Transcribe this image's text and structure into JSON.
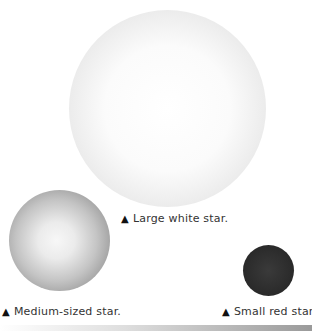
{
  "stars": {
    "large": {
      "caption": "Large white star.",
      "marker": "▲",
      "color": "#f5f5f5"
    },
    "medium": {
      "caption": "Medium-sized star.",
      "marker": "▲",
      "color": "#b0b0b0"
    },
    "small": {
      "caption": "Small red star.",
      "marker": "▲",
      "color": "#2a2a2a"
    }
  }
}
